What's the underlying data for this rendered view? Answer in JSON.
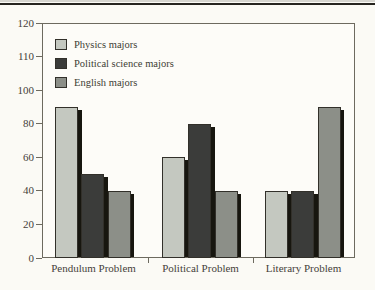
{
  "page": {
    "background": "#fbfaf5",
    "top_rule_color": "#262420"
  },
  "chart_data": {
    "type": "bar",
    "title": "",
    "xlabel": "",
    "ylabel": "",
    "categories": [
      "Pendulum Problem",
      "Political Problem",
      "Literary Problem"
    ],
    "series": [
      {
        "name": "Physics majors",
        "color": "#c4c8c0",
        "values": [
          90,
          60,
          40
        ]
      },
      {
        "name": "Political science majors",
        "color": "#3b3c3a",
        "values": [
          50,
          80,
          40
        ]
      },
      {
        "name": "English majors",
        "color": "#8c8f88",
        "values": [
          40,
          40,
          90
        ]
      }
    ],
    "ylim": [
      0,
      120
    ],
    "yticks_top_to_bottom": [
      "120",
      "110",
      "100",
      "80",
      "60",
      "40",
      "20",
      "0"
    ],
    "grid": false,
    "legend_position": "top-left-inside",
    "axis_note": "tick spacing is visually uniform although intervals are 10 above 100 and 20 below",
    "bar_shadow_color": "#17160f",
    "axis_color": "#6d6a5f",
    "text_color": "#45413a"
  }
}
